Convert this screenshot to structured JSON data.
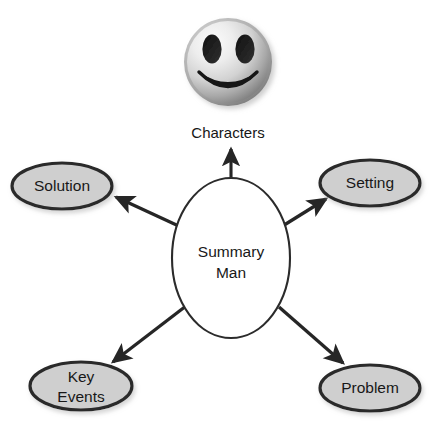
{
  "diagram": {
    "type": "concept-map",
    "title": "Summary Man",
    "background_color": "#ffffff",
    "center": {
      "id": "summary-man",
      "label_line1": "Summary",
      "label_line2": "Man",
      "shape": "ellipse",
      "fill_color": "#ffffff",
      "stroke_color": "#2b2b2b",
      "cx": 231,
      "cy": 258,
      "rx": 59,
      "ry": 80
    },
    "image_node": {
      "id": "characters",
      "caption": "Characters",
      "shape": "sphere-smiley",
      "icon": "smiley-face-icon",
      "gradient_light": "#f2f2f2",
      "gradient_dark": "#8a8a8a",
      "feature_color": "#1a1a1a",
      "cx": 228,
      "cy": 62,
      "r": 44,
      "caption_x": 228,
      "caption_y": 133
    },
    "nodes": [
      {
        "id": "solution",
        "label": "Solution",
        "shape": "ellipse",
        "fill_color": "#cfcfcf",
        "stroke_color": "#2b2b2b",
        "cx": 62,
        "cy": 186,
        "rx": 50,
        "ry": 23
      },
      {
        "id": "setting",
        "label": "Setting",
        "shape": "ellipse",
        "fill_color": "#cfcfcf",
        "stroke_color": "#2b2b2b",
        "cx": 370,
        "cy": 183,
        "rx": 50,
        "ry": 23
      },
      {
        "id": "key-events",
        "label_line1": "Key",
        "label_line2": "Events",
        "label": "Key Events",
        "shape": "ellipse",
        "fill_color": "#cfcfcf",
        "stroke_color": "#2b2b2b",
        "cx": 81,
        "cy": 386,
        "rx": 51,
        "ry": 24
      },
      {
        "id": "problem",
        "label": "Problem",
        "shape": "ellipse",
        "fill_color": "#cfcfcf",
        "stroke_color": "#2b2b2b",
        "cx": 370,
        "cy": 388,
        "rx": 50,
        "ry": 23
      }
    ],
    "connectors": [
      {
        "id": "center-to-characters",
        "from": "summary-man",
        "to": "characters",
        "direction": "up",
        "arrow": "single",
        "color": "#262626",
        "x1": 231,
        "y1": 178,
        "x2": 231,
        "y2": 147
      },
      {
        "id": "center-to-solution",
        "from": "summary-man",
        "to": "solution",
        "direction": "upper-left",
        "arrow": "single",
        "color": "#262626",
        "x1": 183,
        "y1": 228,
        "x2": 112,
        "y2": 196
      },
      {
        "id": "center-to-setting",
        "from": "summary-man",
        "to": "setting",
        "direction": "upper-right",
        "arrow": "single",
        "color": "#262626",
        "x1": 281,
        "y1": 227,
        "x2": 328,
        "y2": 198
      },
      {
        "id": "center-to-key-events",
        "from": "summary-man",
        "to": "key-events",
        "direction": "lower-left",
        "arrow": "single",
        "color": "#262626",
        "x1": 185,
        "y1": 307,
        "x2": 110,
        "y2": 364
      },
      {
        "id": "center-to-problem",
        "from": "summary-man",
        "to": "problem",
        "direction": "lower-right",
        "arrow": "single",
        "color": "#262626",
        "x1": 280,
        "y1": 308,
        "x2": 345,
        "y2": 364
      }
    ]
  }
}
